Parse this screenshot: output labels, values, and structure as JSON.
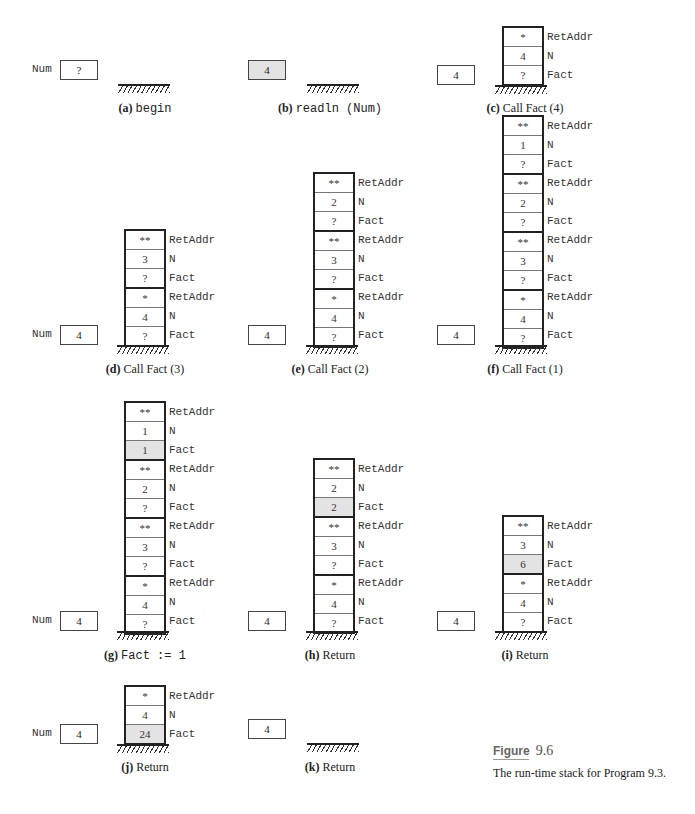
{
  "figure": {
    "title_word": "Figure",
    "number": "9.6",
    "caption": "The run-time stack for Program 9.3."
  },
  "labels": {
    "retaddr": "RetAddr",
    "n": "N",
    "fact": "Fact",
    "num": "Num"
  },
  "panels": [
    {
      "tag": "(a)",
      "caption": "begin",
      "caption_code": true,
      "num_value": "?",
      "num_label": "Num",
      "num_highlight": false,
      "frames": []
    },
    {
      "tag": "(b)",
      "caption": "readln (Num)",
      "caption_code": true,
      "num_value": "4",
      "num_label": "",
      "num_highlight": true,
      "frames": []
    },
    {
      "tag": "(c)",
      "caption": "Call Fact (4)",
      "caption_code": false,
      "num_value": "4",
      "num_label": "",
      "frames": [
        {
          "retaddr": "*",
          "n": "4",
          "fact": "?"
        }
      ]
    },
    {
      "tag": "(d)",
      "caption": "Call Fact (3)",
      "caption_code": false,
      "num_value": "4",
      "num_label": "Num",
      "frames": [
        {
          "retaddr": "**",
          "n": "3",
          "fact": "?"
        },
        {
          "retaddr": "*",
          "n": "4",
          "fact": "?"
        }
      ]
    },
    {
      "tag": "(e)",
      "caption": "Call Fact (2)",
      "caption_code": false,
      "num_value": "4",
      "num_label": "",
      "frames": [
        {
          "retaddr": "**",
          "n": "2",
          "fact": "?"
        },
        {
          "retaddr": "**",
          "n": "3",
          "fact": "?"
        },
        {
          "retaddr": "*",
          "n": "4",
          "fact": "?"
        }
      ]
    },
    {
      "tag": "(f)",
      "caption": "Call Fact (1)",
      "caption_code": false,
      "num_value": "4",
      "num_label": "",
      "frames": [
        {
          "retaddr": "**",
          "n": "1",
          "fact": "?"
        },
        {
          "retaddr": "**",
          "n": "2",
          "fact": "?"
        },
        {
          "retaddr": "**",
          "n": "3",
          "fact": "?"
        },
        {
          "retaddr": "*",
          "n": "4",
          "fact": "?"
        }
      ]
    },
    {
      "tag": "(g)",
      "caption": "Fact := 1",
      "caption_code": true,
      "num_value": "4",
      "num_label": "Num",
      "frames": [
        {
          "retaddr": "**",
          "n": "1",
          "fact": "1",
          "fact_highlight": true
        },
        {
          "retaddr": "**",
          "n": "2",
          "fact": "?"
        },
        {
          "retaddr": "**",
          "n": "3",
          "fact": "?"
        },
        {
          "retaddr": "*",
          "n": "4",
          "fact": "?"
        }
      ]
    },
    {
      "tag": "(h)",
      "caption": "Return",
      "caption_code": false,
      "num_value": "4",
      "num_label": "",
      "frames": [
        {
          "retaddr": "**",
          "n": "2",
          "fact": "2",
          "fact_highlight": true
        },
        {
          "retaddr": "**",
          "n": "3",
          "fact": "?"
        },
        {
          "retaddr": "*",
          "n": "4",
          "fact": "?"
        }
      ]
    },
    {
      "tag": "(i)",
      "caption": "Return",
      "caption_code": false,
      "num_value": "4",
      "num_label": "",
      "frames": [
        {
          "retaddr": "**",
          "n": "3",
          "fact": "6",
          "fact_highlight": true
        },
        {
          "retaddr": "*",
          "n": "4",
          "fact": "?"
        }
      ]
    },
    {
      "tag": "(j)",
      "caption": "Return",
      "caption_code": false,
      "num_value": "4",
      "num_label": "Num",
      "frames": [
        {
          "retaddr": "*",
          "n": "4",
          "fact": "24",
          "fact_highlight": true
        }
      ]
    },
    {
      "tag": "(k)",
      "caption": "Return",
      "caption_code": false,
      "num_value": "4",
      "num_label": "",
      "frames": []
    }
  ],
  "colors": {
    "highlight": "#e3e3e3",
    "border": "#222222"
  }
}
